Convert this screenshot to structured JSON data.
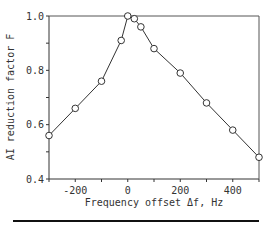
{
  "chart_data": {
    "type": "line",
    "title": "",
    "xlabel": "Frequency offset  Δf, Hz",
    "ylabel": "AI reduction factor  F",
    "xlim": [
      -300,
      500
    ],
    "ylim": [
      0.4,
      1.0
    ],
    "x_ticks": [
      -300,
      -200,
      -100,
      0,
      100,
      200,
      300,
      400,
      500
    ],
    "x_tick_labels": [
      "-200",
      "0",
      "200",
      "400"
    ],
    "x_tick_label_values": [
      -200,
      0,
      200,
      400
    ],
    "y_ticks": [
      0.4,
      0.5,
      0.6,
      0.7,
      0.8,
      0.9,
      1.0
    ],
    "y_tick_labels": [
      "0.4",
      "0.6",
      "0.8",
      "1.0"
    ],
    "y_tick_label_values": [
      0.4,
      0.6,
      0.8,
      1.0
    ],
    "grid": false,
    "legend": null,
    "marker": "open-circle",
    "series": [
      {
        "name": "F",
        "x": [
          -300,
          -200,
          -100,
          -25,
          0,
          25,
          50,
          100,
          200,
          300,
          400,
          500
        ],
        "y": [
          0.56,
          0.66,
          0.76,
          0.91,
          1.0,
          0.99,
          0.96,
          0.88,
          0.79,
          0.68,
          0.58,
          0.48
        ]
      }
    ]
  }
}
